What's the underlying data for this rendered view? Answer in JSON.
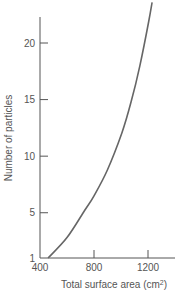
{
  "chart_data": {
    "type": "line",
    "title": "",
    "xlabel": "Total surface area (cm²)",
    "xlabel_base": "Total surface area (cm",
    "xlabel_sup": "2",
    "xlabel_end": ")",
    "ylabel": "Number of particles",
    "xlim": [
      400,
      1400
    ],
    "ylim": [
      1,
      23
    ],
    "xticks": [
      400,
      800,
      1200
    ],
    "yticks": [
      1,
      5,
      10,
      15,
      20
    ],
    "grid": false,
    "legend": null,
    "series": [
      {
        "name": "Number of particles vs total surface area",
        "x": [
          460,
          600,
          730,
          800,
          900,
          1005,
          1075,
          1140,
          1205,
          1230
        ],
        "y": [
          1,
          2.8,
          5.2,
          6.5,
          8.8,
          12,
          14.8,
          18,
          21.9,
          23.6
        ],
        "color": "#666666"
      }
    ]
  }
}
